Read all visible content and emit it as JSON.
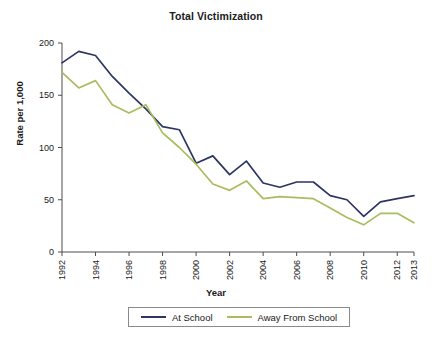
{
  "chart_data": {
    "type": "line",
    "title": "Total Victimization",
    "xlabel": "Year",
    "ylabel": "Rate per 1,000",
    "x": [
      1992,
      1993,
      1994,
      1995,
      1996,
      1997,
      1998,
      1999,
      2000,
      2001,
      2002,
      2003,
      2004,
      2005,
      2006,
      2007,
      2008,
      2009,
      2010,
      2011,
      2012,
      2013
    ],
    "xtick_labels": [
      "1992",
      "1994",
      "1996",
      "1998",
      "2000",
      "2002",
      "2004",
      "2006",
      "2008",
      "2010",
      "2012",
      "2013"
    ],
    "xtick_values": [
      1992,
      1994,
      1996,
      1998,
      2000,
      2002,
      2004,
      2006,
      2008,
      2010,
      2012,
      2013
    ],
    "ytick_labels": [
      "0",
      "50",
      "100",
      "150",
      "200"
    ],
    "ytick_values": [
      0,
      50,
      100,
      150,
      200
    ],
    "ylim": [
      0,
      200
    ],
    "xlim": [
      1992,
      2013
    ],
    "grid": false,
    "legend_position": "bottom",
    "series": [
      {
        "name": "At School",
        "color": "#2d3561",
        "values": [
          181,
          192,
          188,
          168,
          152,
          137,
          120,
          117,
          85,
          92,
          74,
          87,
          66,
          62,
          67,
          67,
          54,
          50,
          34,
          48,
          51,
          54
        ]
      },
      {
        "name": "Away From School",
        "color": "#a8bd5e",
        "values": [
          172,
          157,
          164,
          141,
          133,
          141,
          114,
          100,
          84,
          65,
          59,
          68,
          51,
          53,
          52,
          51,
          42,
          33,
          26,
          37,
          37,
          28
        ]
      }
    ]
  },
  "legend": {
    "items": [
      {
        "label": "At School",
        "color": "#2d3561"
      },
      {
        "label": "Away From School",
        "color": "#a8bd5e"
      }
    ]
  }
}
